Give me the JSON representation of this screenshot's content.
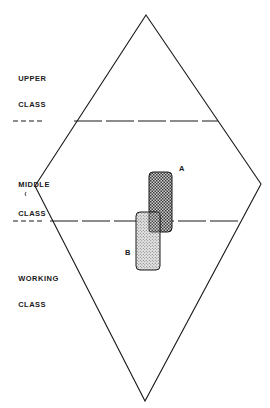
{
  "diagram": {
    "type": "social-class-diamond",
    "shape": {
      "top": [
        146,
        15
      ],
      "right": [
        261,
        184
      ],
      "bottom": [
        145,
        401
      ],
      "left": [
        35,
        186
      ],
      "stroke": "#1a1a1a"
    },
    "class_labels": [
      {
        "id": "upper",
        "line1": "UPPER",
        "line2": "CLASS"
      },
      {
        "id": "middle",
        "line1": "MIDDLE",
        "line2": "CLASS"
      },
      {
        "id": "working",
        "line1": "WORKING",
        "line2": "CLASS"
      }
    ],
    "boundaries": [
      {
        "name": "upper-middle boundary",
        "y": 121
      },
      {
        "name": "middle-working boundary",
        "y": 221
      }
    ],
    "regions": [
      {
        "label": "A",
        "pattern": "crosshatch",
        "x": 149,
        "y": 172,
        "w": 23,
        "h": 60
      },
      {
        "label": "B",
        "pattern": "stipple",
        "x": 136,
        "y": 212,
        "w": 24,
        "h": 58
      }
    ]
  }
}
